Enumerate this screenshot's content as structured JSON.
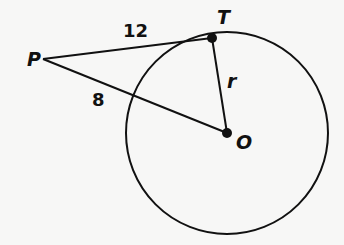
{
  "diagram": {
    "points": {
      "P": {
        "label": "P",
        "x": 43,
        "y": 59
      },
      "T": {
        "label": "T",
        "x": 212,
        "y": 38
      },
      "O": {
        "label": "O",
        "x": 227,
        "y": 133
      }
    },
    "circle": {
      "center": "O",
      "radius_px": 101
    },
    "segments": [
      {
        "from": "P",
        "to": "T",
        "label": "12"
      },
      {
        "from": "P",
        "to": "circle",
        "label": "8"
      },
      {
        "from": "T",
        "to": "O",
        "label": "r"
      }
    ],
    "labels": {
      "P": "P",
      "T": "T",
      "O": "O",
      "PT": "12",
      "PA": "8",
      "TO": "r"
    },
    "colors": {
      "stroke": "#111111",
      "background": "#f7f7f6"
    }
  }
}
